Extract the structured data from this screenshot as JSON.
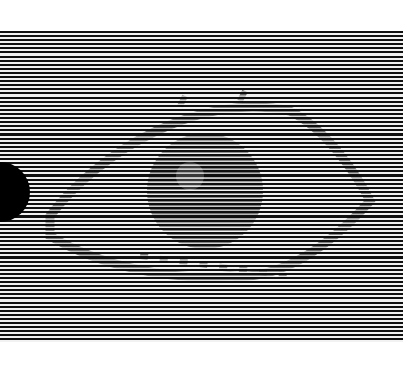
{
  "image": {
    "description": "Horizontal black and white line pattern with a hidden eye shape and a black half-circle on the left edge",
    "colors": {
      "stripe_dark": "#111111",
      "stripe_light": "#f2f2f2",
      "dot": "#000000"
    },
    "elements": [
      "striped-background",
      "hidden-eye",
      "black-half-circle"
    ]
  }
}
